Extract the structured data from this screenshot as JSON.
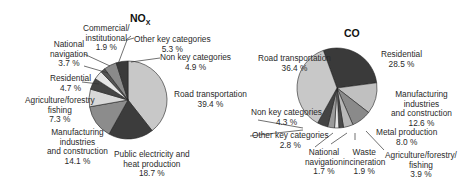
{
  "chart_data": [
    {
      "type": "pie",
      "title": "NOx",
      "title_main": "NO",
      "title_sub": "X",
      "slices": [
        {
          "label": "Road transportation",
          "value": 39.4,
          "color": "#c8c8c8"
        },
        {
          "label": "Public electricity and heat production",
          "value": 18.7,
          "color": "#3c3c3c"
        },
        {
          "label": "Manufacturing industries and construction",
          "value": 14.1,
          "color": "#8c8c8c"
        },
        {
          "label": "Agriculture/forestry/fishing",
          "value": 7.3,
          "color": "#d8d8d8"
        },
        {
          "label": "Residential",
          "value": 4.7,
          "color": "#444444"
        },
        {
          "label": "National navigation",
          "value": 3.7,
          "color": "#e6e6e6"
        },
        {
          "label": "Commercial/institutional",
          "value": 1.9,
          "color": "#555555"
        },
        {
          "label": "Other key categories",
          "value": 5.3,
          "color": "#8a8a8a"
        },
        {
          "label": "Non key categories",
          "value": 4.9,
          "color": "#3a3a3a"
        }
      ]
    },
    {
      "type": "pie",
      "title": "CO",
      "slices": [
        {
          "label": "Residential",
          "value": 28.5,
          "color": "#3a3a3a"
        },
        {
          "label": "Manufacturing industries and construction",
          "value": 12.6,
          "color": "#c0c0c0"
        },
        {
          "label": "Metal production",
          "value": 8.0,
          "color": "#8a8a8a"
        },
        {
          "label": "Agriculture/forestry/fishing",
          "value": 3.9,
          "color": "#b8b8b8"
        },
        {
          "label": "Waste incineration",
          "value": 1.9,
          "color": "#4a4a4a"
        },
        {
          "label": "National navigation",
          "value": 1.7,
          "color": "#e8e8e8"
        },
        {
          "label": "Other key categories",
          "value": 2.8,
          "color": "#9a9a9a"
        },
        {
          "label": "Non key categories",
          "value": 4.3,
          "color": "#444444"
        },
        {
          "label": "Road transportation",
          "value": 36.4,
          "color": "#c8c8c8"
        }
      ]
    }
  ],
  "labels": {
    "nox": {
      "road": [
        "Road transportation",
        "39.4 %"
      ],
      "public": [
        "Public electricity and",
        "heat production",
        "18.7 %"
      ],
      "manuf": [
        "Manufacturing",
        "industries",
        "and construction",
        "14.1 %"
      ],
      "agri": [
        "Agriculture/forestry",
        "fishing",
        "7.3 %"
      ],
      "resid": [
        "Residential",
        "4.7 %"
      ],
      "natnav": [
        "National",
        "navigation",
        "3.7 %"
      ],
      "comm": [
        "Commercial/",
        "institutional",
        "1.9 %"
      ],
      "other": [
        "Other key categories",
        "5.3 %"
      ],
      "nonkey": [
        "Non key categories",
        "4.9 %"
      ]
    },
    "co": {
      "road": [
        "Road transportation",
        "36.4 %"
      ],
      "resid": [
        "Residential",
        "28.5 %"
      ],
      "manuf": [
        "Manufacturing",
        "industries",
        "and construction",
        "12.6 %"
      ],
      "metal": [
        "Metal production",
        "8.0 %"
      ],
      "agri": [
        "Agriculture/forestry/",
        "fishing",
        "3.9 %"
      ],
      "waste": [
        "Waste",
        "incineration",
        "1.9 %"
      ],
      "natnav": [
        "National",
        "navigation",
        "1.7 %"
      ],
      "other": [
        "Other key categories",
        "2.8 %"
      ],
      "nonkey": [
        "Non key categories",
        "4.3 %"
      ]
    }
  }
}
